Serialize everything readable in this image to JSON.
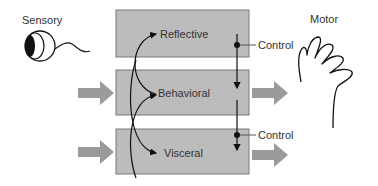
{
  "diagram": {
    "input_label": "Sensory",
    "output_label": "Motor",
    "layers": [
      {
        "id": "reflective",
        "label": "Reflective"
      },
      {
        "id": "behavioral",
        "label": "Behavioral"
      },
      {
        "id": "visceral",
        "label": "Visceral"
      }
    ],
    "control_labels": [
      "Control",
      "Control"
    ],
    "icons": {
      "input": "eye-icon",
      "output": "hand-icon"
    },
    "colors": {
      "box_fill": "#bdbdbd",
      "box_stroke": "#7a7a7a",
      "arrow_fill": "#9a9a9a",
      "line": "#111111",
      "text": "#333333"
    }
  }
}
